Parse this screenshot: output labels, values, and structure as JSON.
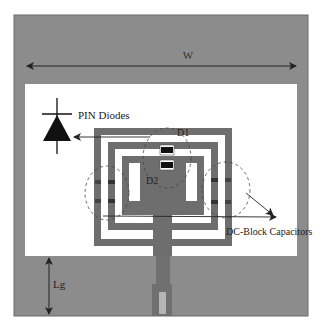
{
  "figure": {
    "type": "antenna-layout-diagram",
    "colors": {
      "background": "#ffffff",
      "substrate_gray": "#8a8a8a",
      "board_border": "#6a6a6a",
      "window_white": "#ffffff",
      "metal_dark": "#6b6b6b",
      "diode_black": "#111111",
      "annotation_line": "#222222"
    }
  },
  "labels": {
    "width_dimension": "W",
    "ground_length_dimension": "Lg",
    "pin_diodes": "PIN Diodes",
    "diode_1": "D1",
    "diode_2": "D2",
    "dc_block_capacitors": "DC-Block Capacitors"
  },
  "components": {
    "diodes": [
      {
        "id": "D1",
        "label": "D1"
      },
      {
        "id": "D2",
        "label": "D2"
      }
    ],
    "capacitor_groups": [
      {
        "side": "left",
        "count": 4
      },
      {
        "side": "right",
        "count": 4
      }
    ],
    "feed_line": {
      "label": ""
    }
  }
}
